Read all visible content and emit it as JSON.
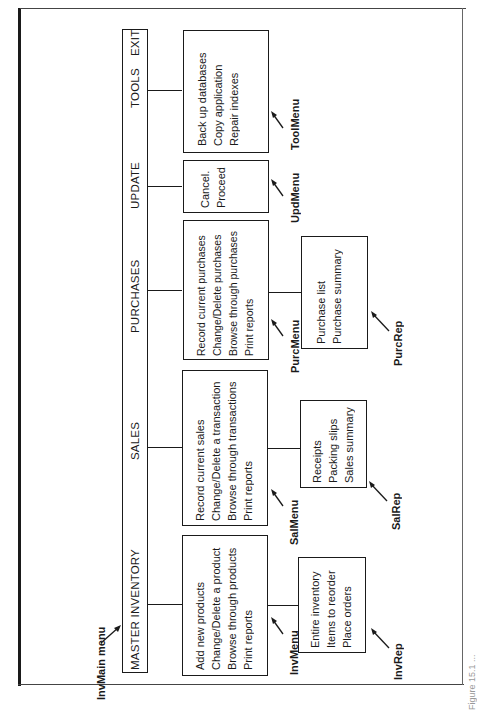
{
  "main_menu": {
    "name": "InvMain menu",
    "items": [
      "MASTER INVENTORY",
      "SALES",
      "PURCHASES",
      "UPDATE",
      "TOOLS",
      "EXIT"
    ]
  },
  "submenus": {
    "inventory": {
      "name": "InvMenu",
      "items": [
        "Add new products",
        "Change/Delete a product",
        "Browse through products",
        "Print reports"
      ]
    },
    "sales": {
      "name": "SalMenu",
      "items": [
        "Record current sales",
        "Change/Delete a transaction",
        "Browse through transactions",
        "Print reports"
      ]
    },
    "purchases": {
      "name": "PurcMenu",
      "items": [
        "Record current purchases",
        "Change/Delete purchases",
        "Browse through purchases",
        "Print reports"
      ]
    },
    "update": {
      "name": "UpdMenu",
      "items": [
        "Cancel.",
        "Proceed"
      ]
    },
    "tools": {
      "name": "ToolMenu",
      "items": [
        "Back up databases",
        "Copy application",
        "Repair indexes"
      ]
    }
  },
  "report_menus": {
    "inventory": {
      "name": "InvRep",
      "items": [
        "Entire inventory",
        "Items to reorder",
        "Place orders"
      ]
    },
    "sales": {
      "name": "SalRep",
      "items": [
        "Receipts",
        "Packing slips",
        "Sales summary"
      ]
    },
    "purchases": {
      "name": "PurcRep",
      "items": [
        "Purchase list",
        "Purchase summary"
      ]
    }
  },
  "caption": "Figure 15.1 ..."
}
